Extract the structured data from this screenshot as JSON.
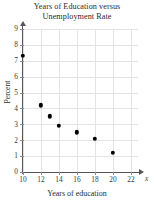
{
  "chart_data": {
    "type": "scatter",
    "title": "Years of Education versus Unemployment Rate",
    "title_lines": [
      "Years of Education versus",
      "Unemployment Rate"
    ],
    "xlabel": "Years of education",
    "ylabel": "Percent",
    "x_axis_variable": "x",
    "xlim": [
      10,
      22
    ],
    "ylim": [
      0,
      9
    ],
    "x_ticks": [
      10,
      12,
      14,
      16,
      18,
      20,
      22
    ],
    "y_ticks": [
      0,
      1,
      2,
      3,
      4,
      5,
      6,
      7,
      8,
      9
    ],
    "grid": true,
    "legend": null,
    "marker_color": "#000000",
    "axis_color": "#555555",
    "grid_color": "#e3e3e3",
    "x": [
      10,
      12,
      13,
      14,
      16,
      18,
      20
    ],
    "y": [
      7.3,
      4.2,
      3.5,
      2.9,
      2.5,
      2.1,
      1.2
    ],
    "points": [
      {
        "x": 10,
        "y": 7.3
      },
      {
        "x": 12,
        "y": 4.2
      },
      {
        "x": 13,
        "y": 3.5
      },
      {
        "x": 14,
        "y": 2.9
      },
      {
        "x": 16,
        "y": 2.5
      },
      {
        "x": 18,
        "y": 2.1
      },
      {
        "x": 20,
        "y": 1.2
      }
    ]
  }
}
